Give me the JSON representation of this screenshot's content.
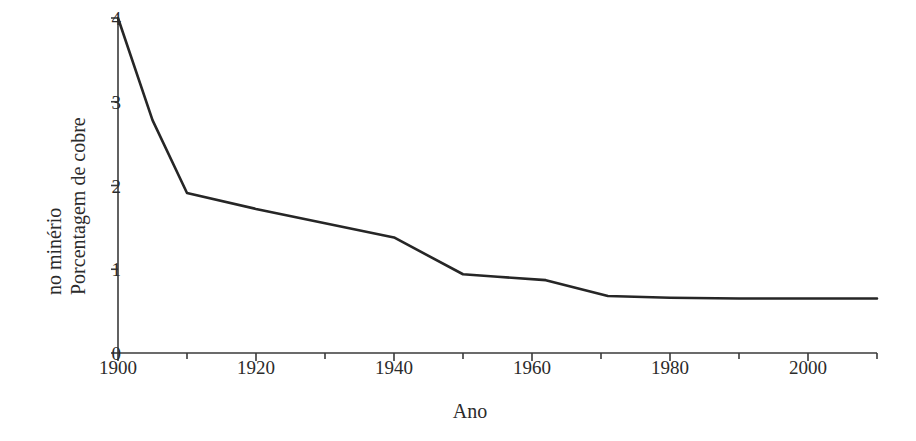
{
  "chart_data": {
    "type": "line",
    "title": "",
    "subtitle": "",
    "xlabel": "Ano",
    "ylabel_line1": "Porcentagem de cobre",
    "ylabel_line2": "no minério",
    "ylabel": "Porcentagem de cobre no minério",
    "xlim": [
      1900,
      2010
    ],
    "ylim": [
      0,
      4
    ],
    "grid": false,
    "legend": false,
    "legend_position": "none",
    "x_major_ticks": [
      1900,
      1920,
      1940,
      1960,
      1980,
      2000
    ],
    "x_minor_ticks": [
      1910,
      1930,
      1950,
      1970,
      1990,
      2010
    ],
    "x_tick_labels": [
      "1900",
      "1920",
      "1940",
      "1960",
      "1980",
      "2000"
    ],
    "y_major_ticks": [
      0,
      1,
      2,
      3,
      4
    ],
    "y_tick_labels": [
      "0",
      "1",
      "2",
      "3",
      "4"
    ],
    "line_color": "#262626",
    "line_width": 2.6,
    "series": [
      {
        "name": "Teor de cobre no minério",
        "x": [
          1900,
          1905,
          1910,
          1920,
          1930,
          1940,
          1950,
          1955,
          1962,
          1971,
          1980,
          1990,
          2000,
          2010
        ],
        "values": [
          4.0,
          2.78,
          1.91,
          1.72,
          1.55,
          1.38,
          0.94,
          0.91,
          0.87,
          0.68,
          0.66,
          0.65,
          0.65,
          0.65
        ]
      }
    ]
  },
  "figure": {
    "background_color": "#ffffff",
    "axis_color": "#3a3a3a"
  }
}
